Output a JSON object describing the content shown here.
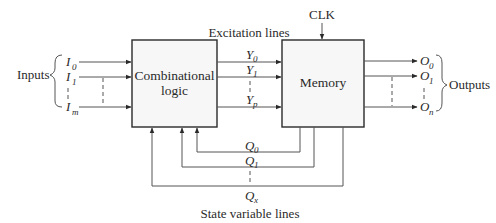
{
  "diagram": {
    "type": "sequential-circuit-block-diagram",
    "clock_label": "CLK",
    "excitation_label": "Excitation lines",
    "state_variable_label": "State variable lines",
    "inputs_label": "Inputs",
    "outputs_label": "Outputs",
    "blocks": {
      "combinational": {
        "line1": "Combinational",
        "line2": "logic"
      },
      "memory": {
        "label": "Memory"
      }
    },
    "inputs": [
      {
        "sym": "I",
        "sub": "0"
      },
      {
        "sym": "I",
        "sub": "1"
      },
      {
        "sym": "I",
        "sub": "m"
      }
    ],
    "excitation": [
      {
        "sym": "Y",
        "sub": "0"
      },
      {
        "sym": "Y",
        "sub": "1"
      },
      {
        "sym": "Y",
        "sub": "p"
      }
    ],
    "outputs": [
      {
        "sym": "O",
        "sub": "0"
      },
      {
        "sym": "O",
        "sub": "1"
      },
      {
        "sym": "O",
        "sub": "n"
      }
    ],
    "state_vars": [
      {
        "sym": "Q",
        "sub": "0"
      },
      {
        "sym": "Q",
        "sub": "1"
      },
      {
        "sym": "Q",
        "sub": "x"
      }
    ],
    "colors": {
      "line": "#555555",
      "block_fill": "#f7f7f7",
      "block_stroke": "#2a2a2a"
    }
  }
}
